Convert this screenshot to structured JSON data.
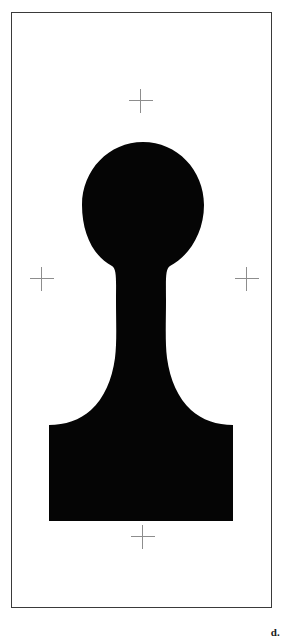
{
  "plate": {
    "label": "d.",
    "background_color": "#ffffff",
    "frame_color": "#3a3a3a",
    "silhouette_color": "#050505",
    "crosshair_color": "#8d8d8d",
    "frame": {
      "x": 11,
      "y": 12,
      "width": 261,
      "height": 596
    },
    "subject_description": "black silhouette of a pawn-shaped object with rounded bulbous head, tapered neck and flared rectangular base"
  },
  "registration_marks": [
    {
      "name": "top",
      "x": 140,
      "y": 100
    },
    {
      "name": "left",
      "x": 41,
      "y": 278
    },
    {
      "name": "right",
      "x": 246,
      "y": 278
    },
    {
      "name": "bottom",
      "x": 142,
      "y": 536
    }
  ],
  "silhouette": {
    "head": {
      "center_x": 143,
      "center_y": 204,
      "radius_x": 61,
      "radius_y": 62,
      "top_y": 142,
      "bottom_y": 266
    },
    "neck": {
      "left_x": 122,
      "right_x": 167,
      "top_y": 266,
      "bottom_y": 348
    },
    "base": {
      "left_x": 49,
      "right_x": 233,
      "top_y": 425,
      "bottom_y": 521
    },
    "path": "M 143 142 C 177 142 204 170 204 205 C 204 240 180 266 167 272 C 163 276 166 300 166 320 C 166 352 168 375 182 395 C 196 415 214 424 233 425 L 233 521 L 49 521 L 49 425 C 69 424 88 414 101 394 C 114 374 122 352 122 320 C 122 300 124 276 120 272 C 106 266 82 240 82 205 C 82 170 109 142 143 142 Z"
  }
}
